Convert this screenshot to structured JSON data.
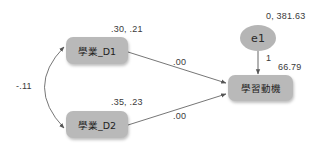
{
  "diagram": {
    "type": "path-diagram (SEM)",
    "nodes": {
      "d1": {
        "label": "學業_D1",
        "estimates": ".30, .21"
      },
      "d2": {
        "label": "學業_D2",
        "estimates": ".35, .23"
      },
      "outcome": {
        "label": "學習動機",
        "intercept": "66.79"
      },
      "error": {
        "label": "e1",
        "estimates": "0, 381.63"
      }
    },
    "paths": {
      "d1_to_outcome": ".00",
      "d2_to_outcome": ".00",
      "error_to_outcome": "1",
      "d1_d2_covariance": "-.11"
    },
    "colors": {
      "node_fill": "#b9b9b9",
      "line": "#555555",
      "text": "#3a3a3a",
      "background": "#ffffff"
    }
  }
}
